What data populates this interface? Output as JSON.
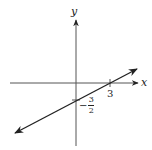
{
  "diagram": {
    "x_axis_label": "x",
    "y_axis_label": "y",
    "x_intercept_label": "3",
    "y_intercept": {
      "sign": "−",
      "numerator": "3",
      "denominator": "2"
    },
    "line": {
      "slope": "1/2",
      "x_intercept": 3,
      "y_intercept": -1.5
    },
    "colors": {
      "ink": "#222222",
      "background": "#ffffff"
    }
  }
}
